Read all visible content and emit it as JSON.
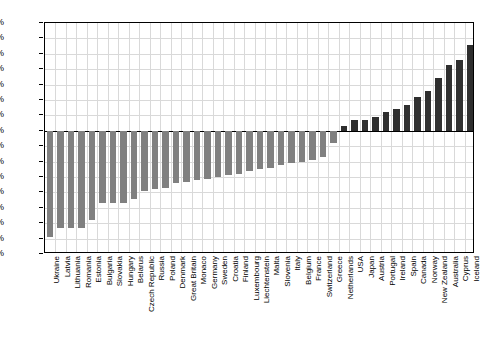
{
  "chart_data": {
    "type": "bar",
    "title": "",
    "subtitle": "",
    "xlabel": "",
    "ylabel": "",
    "ylim": [
      -80,
      70
    ],
    "ytick_step": 10,
    "grid": true,
    "legend": false,
    "value_format": "percent",
    "ytick_labels": [
      "70%",
      "60%",
      "50%",
      "40%",
      "30%",
      "20%",
      "10%",
      "0%",
      "-10%",
      "-20%",
      "-30%",
      "-40%",
      "-50%",
      "-60%",
      "-70%",
      "-80%"
    ],
    "ytick_values": [
      70,
      60,
      50,
      40,
      30,
      20,
      10,
      0,
      -10,
      -20,
      -30,
      -40,
      -50,
      -60,
      -70,
      -80
    ],
    "colors": {
      "negative_bar": "#808080",
      "positive_bar": "#2e2e2e",
      "grid": "#d9d9d9",
      "axis": "#000000",
      "background": "#ffffff"
    },
    "categories": [
      "Ukraine",
      "Latvia",
      "Lithuania",
      "Romania",
      "Estonia",
      "Bulgaria",
      "Slovakia",
      "Hungary",
      "Belarus",
      "Czech Republic",
      "Russia",
      "Poland",
      "Denmark",
      "Great Britain",
      "Monaco",
      "Germany",
      "Sweden",
      "Croatia",
      "Finland",
      "Luxembourg",
      "Liechtenstein",
      "Malta",
      "Slovenia",
      "Italy",
      "Belgium",
      "France",
      "Switzerland",
      "Greece",
      "Netherlands",
      "USA",
      "Japan",
      "Austria",
      "Portugal",
      "Ireland",
      "Spain",
      "Canada",
      "Norway",
      "New Zealand",
      "Australia",
      "Cyprus",
      "Iceland"
    ],
    "values": [
      -69,
      -63,
      -63,
      -63,
      -58,
      -47,
      -47,
      -47,
      -44,
      -39,
      -38,
      -37,
      -34,
      -33,
      -32,
      -31,
      -30,
      -29,
      -28,
      -26,
      -25,
      -24,
      -22,
      -21,
      -20,
      -19,
      -17,
      -8,
      3,
      7,
      7,
      9,
      12,
      14,
      17,
      22,
      26,
      34,
      43,
      46,
      56
    ]
  }
}
